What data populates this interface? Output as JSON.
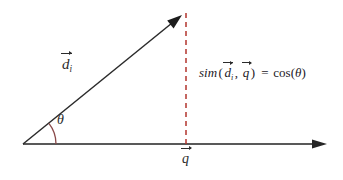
{
  "figure": {
    "background_color": "#ffffff"
  },
  "labels": {
    "document_vector": {
      "symbol": "d",
      "subscript": "i",
      "full": "d⃗i"
    },
    "query_vector": {
      "symbol": "q",
      "full": "q⃗"
    },
    "angle": {
      "symbol": "θ"
    },
    "formula": {
      "function_name": "sim",
      "open_paren": "(",
      "arg1_symbol": "d",
      "arg1_subscript": "i",
      "comma": ",",
      "arg2_symbol": "q",
      "close_paren": ")",
      "equals": "=",
      "cos_name": "cos",
      "cos_open": "(",
      "cos_arg": "θ",
      "cos_close": ")",
      "full": "sim(d⃗i, q⃗) = cos(θ)"
    }
  },
  "colors": {
    "axis": "#595959",
    "vector": "#2b2b2b",
    "angle_arc": "#8a4a4a",
    "projection_dashed": "#b3342e",
    "text": "#2b2b2b"
  },
  "geometry": {
    "origin": [
      23,
      144
    ],
    "axis_end": [
      327,
      144
    ],
    "vector_tip": [
      182,
      15
    ],
    "projection_foot": [
      186,
      144
    ],
    "projection_top": [
      186,
      13
    ],
    "arc_radius": 33
  }
}
